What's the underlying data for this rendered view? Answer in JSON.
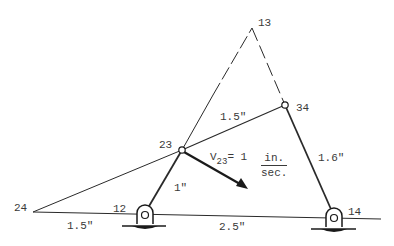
{
  "diagram": {
    "type": "four-bar linkage with instant centers",
    "colors": {
      "line": "#2a2a2a",
      "text": "#3a3a3a",
      "background": "#ffffff"
    },
    "nodes": [
      {
        "id": "13",
        "label": "13",
        "x": 252,
        "y": 28
      },
      {
        "id": "34",
        "label": "34",
        "x": 285,
        "y": 105
      },
      {
        "id": "23",
        "label": "23",
        "x": 182,
        "y": 150
      },
      {
        "id": "24",
        "label": "24",
        "x": 33,
        "y": 212
      },
      {
        "id": "12",
        "label": "12",
        "x": 145,
        "y": 215
      },
      {
        "id": "14",
        "label": "14",
        "x": 334,
        "y": 218
      }
    ],
    "dimensions": {
      "link_23_34": "1.5\"",
      "link_12_23": "1\"",
      "link_34_14": "1.6\"",
      "ground_24_12": "1.5\"",
      "ground_12_14": "2.5\""
    },
    "velocity": {
      "symbol": "V",
      "subscript": "23",
      "equals": "= 1",
      "unit_numerator": "in.",
      "unit_denominator": "sec."
    },
    "icons": {
      "pivot_ground": "ground-pivot-icon",
      "joint": "pin-joint-icon",
      "arrow": "velocity-arrow-icon"
    }
  }
}
